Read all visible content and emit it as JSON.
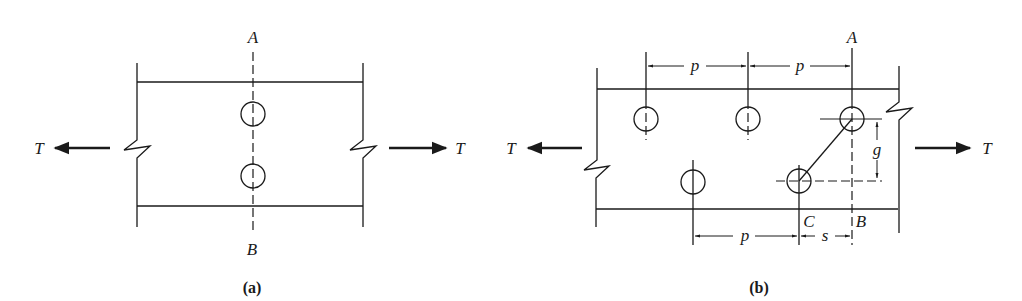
{
  "figure_a": {
    "caption": "(a)",
    "labels": {
      "top_section": "A",
      "bottom_section": "B",
      "tension_left": "T",
      "tension_right": "T"
    }
  },
  "figure_b": {
    "caption": "(b)",
    "labels": {
      "top_section": "A",
      "bottom_section_B": "B",
      "bottom_section_C": "C",
      "tension_left": "T",
      "tension_right": "T",
      "pitch_top_1": "p",
      "pitch_top_2": "p",
      "pitch_bottom": "p",
      "stagger": "s",
      "gage": "g"
    }
  },
  "colors": {
    "ink": "#1a1a1a",
    "background": "#ffffff"
  }
}
